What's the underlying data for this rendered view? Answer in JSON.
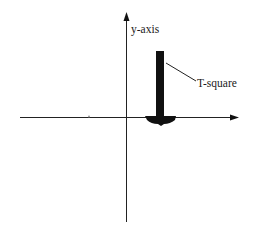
{
  "diagram": {
    "labels": {
      "y_axis": "y-axis",
      "t_square": "T-square"
    },
    "colors": {
      "ink": "#111111",
      "background": "#ffffff"
    },
    "elements": [
      {
        "name": "x-axis",
        "type": "arrow-line",
        "direction": "right"
      },
      {
        "name": "y-axis",
        "type": "arrow-line",
        "direction": "up"
      },
      {
        "name": "t-square",
        "type": "filled-shape",
        "orientation": "blade vertical, head on x-axis"
      },
      {
        "name": "t-square-leader",
        "type": "line",
        "points_to": "t-square blade"
      },
      {
        "name": "tick-mark",
        "type": "dot",
        "on": "x-axis"
      }
    ]
  }
}
